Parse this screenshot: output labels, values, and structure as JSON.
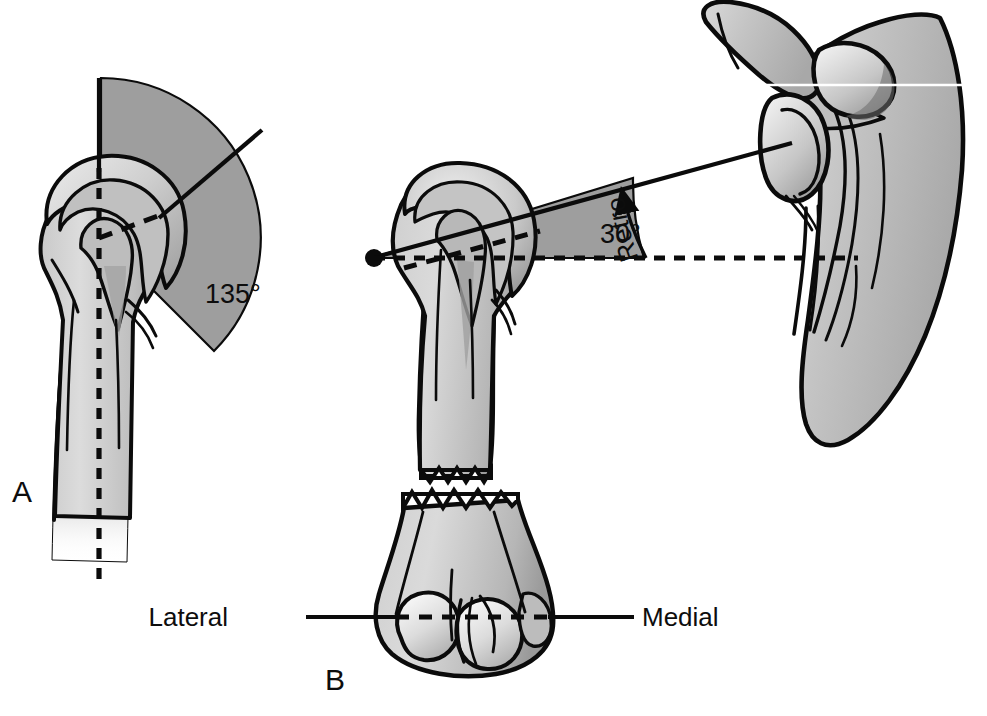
{
  "figure": {
    "background_color": "#ffffff"
  },
  "palette": {
    "outline": "#0b0b0b",
    "bone_light": "#d6d6d6",
    "bone_mid": "#b4b4b4",
    "bone_shadow": "#8f8f8f",
    "bone_highlight": "#ededed",
    "wedge_fill": "#9e9e9e",
    "text": "#0d0d0d",
    "reference_white": "#ffffff"
  },
  "panels": [
    {
      "id": "A",
      "letter": "A",
      "view": "anterior",
      "description": "Anterior view of proximal humerus showing the neck-shaft angle between the humeral shaft axis and the anatomic neck line.",
      "annotations": [
        {
          "name": "neck-shaft-angle",
          "value": "135°",
          "value_number": 135,
          "unit": "degrees",
          "x": 238,
          "y": 293
        }
      ],
      "reference_lines": [
        {
          "name": "shaft-axis-solid",
          "style": "solid",
          "orientation": "vertical"
        },
        {
          "name": "shaft-axis-dashed",
          "style": "dashed",
          "orientation": "vertical"
        },
        {
          "name": "anatomic-neck-line",
          "style": "solid",
          "orientation": "oblique"
        },
        {
          "name": "anatomic-neck-dashed",
          "style": "dashed",
          "orientation": "oblique"
        }
      ]
    },
    {
      "id": "B",
      "letter": "B",
      "view": "superior / axial",
      "description": "Axial view showing humeral head retroversion relative to the transepicondylar axis of the distal humerus, with the scapula and glenoid at right.",
      "annotations": [
        {
          "name": "retroversion-angle",
          "value": "30°",
          "value_number": 30,
          "unit": "degrees",
          "x": 617,
          "y": 232
        },
        {
          "name": "retroversion-arc-label",
          "value": "Retroversion",
          "curved": true
        }
      ],
      "axis_labels": {
        "lateral": "Lateral",
        "medial": "Medial"
      },
      "reference_lines": [
        {
          "name": "head-axis-solid",
          "style": "solid",
          "orientation": "oblique"
        },
        {
          "name": "transepicondylar-axis-dashed",
          "style": "dashed",
          "orientation": "horizontal"
        },
        {
          "name": "scapular-reference-white",
          "style": "solid",
          "orientation": "horizontal"
        },
        {
          "name": "epicondylar-line-solid",
          "style": "solid",
          "orientation": "horizontal"
        }
      ]
    }
  ],
  "structures": [
    {
      "name": "humerus-proximal-anterior",
      "panel": "A"
    },
    {
      "name": "humeral-shaft-anterior",
      "panel": "A"
    },
    {
      "name": "humerus-proximal-axial",
      "panel": "B"
    },
    {
      "name": "humerus-distal-axial",
      "panel": "B"
    },
    {
      "name": "scapula",
      "panel": "B"
    },
    {
      "name": "glenoid-fossa",
      "panel": "B"
    },
    {
      "name": "acromion",
      "panel": "B"
    },
    {
      "name": "coracoid-process",
      "panel": "B"
    }
  ]
}
